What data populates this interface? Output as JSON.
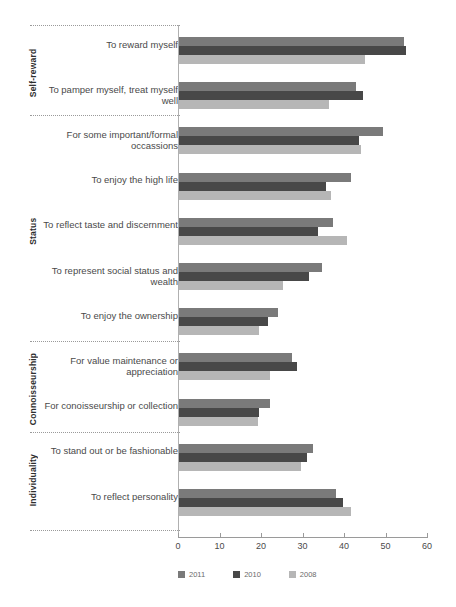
{
  "chart_data": {
    "type": "bar",
    "orientation": "horizontal",
    "title": "",
    "xlabel": "",
    "ylabel": "",
    "xlim": [
      0,
      60
    ],
    "xticks": [
      0,
      10,
      20,
      30,
      40,
      50,
      60
    ],
    "xticklabels": [
      "0",
      "10",
      "20",
      "30",
      "40",
      "50",
      "60"
    ],
    "grid": false,
    "legend": {
      "position": "bottom",
      "entries": [
        {
          "name": "2011",
          "color": "#7a7a7a"
        },
        {
          "name": "2010",
          "color": "#484848"
        },
        {
          "name": "2008",
          "color": "#b6b6b6"
        }
      ]
    },
    "groups": [
      {
        "label": "Self-reward",
        "categories": [
          "To reward myself",
          "To pamper myself, treat myself well"
        ]
      },
      {
        "label": "Status",
        "categories": [
          "For some important/formal occassions",
          "To enjoy the high life",
          "To reflect taste and discernment",
          "To represent social status and wealth",
          "To enjoy the ownership"
        ]
      },
      {
        "label": "Connoisseurship",
        "categories": [
          "For value maintenance or appreciation",
          "For conoisseurship or collection"
        ]
      },
      {
        "label": "Individuality",
        "categories": [
          "To stand out or be fashionable",
          "To reflect personality"
        ]
      }
    ],
    "categories": [
      "To reward myself",
      "To pamper myself, treat myself well",
      "For some important/formal occassions",
      "To enjoy the high life",
      "To reflect taste and discernment",
      "To represent social status and wealth",
      "To enjoy the ownership",
      "For value maintenance or appreciation",
      "For conoisseurship or collection",
      "To stand out or be fashionable",
      "To reflect personality"
    ],
    "series": [
      {
        "name": "2011",
        "color": "#7a7a7a",
        "values": [
          54.5,
          43.0,
          49.5,
          41.7,
          37.3,
          34.6,
          24.2,
          27.4,
          22.2,
          32.6,
          38.1
        ]
      },
      {
        "name": "2010",
        "color": "#484848",
        "values": [
          55.0,
          44.5,
          43.5,
          35.7,
          33.7,
          31.5,
          21.7,
          28.6,
          19.6,
          31.1,
          39.8
        ]
      },
      {
        "name": "2008",
        "color": "#b6b6b6",
        "values": [
          45.0,
          36.5,
          44.0,
          36.8,
          40.7,
          25.3,
          19.5,
          22.2,
          19.2,
          29.6,
          41.7
        ]
      }
    ]
  }
}
